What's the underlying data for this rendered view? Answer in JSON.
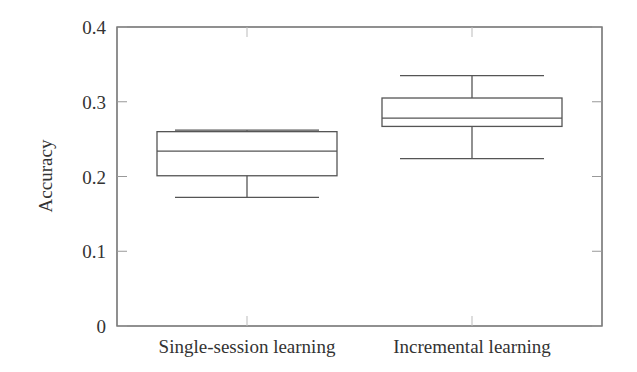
{
  "chart_data": {
    "type": "boxplot",
    "title": "",
    "xlabel": "",
    "ylabel": "Accuracy",
    "ylim": [
      0,
      0.4
    ],
    "yticks": [
      0,
      0.1,
      0.2,
      0.3,
      0.4
    ],
    "ytick_labels": [
      "0",
      "0.1",
      "0.2",
      "0.3",
      "0.4"
    ],
    "grid": false,
    "categories": [
      "Single-session learning",
      "Incremental learning"
    ],
    "series": [
      {
        "name": "Single-session learning",
        "whisker_low": 0.172,
        "q1": 0.201,
        "median": 0.234,
        "q3": 0.26,
        "whisker_high": 0.262
      },
      {
        "name": "Incremental learning",
        "whisker_low": 0.224,
        "q1": 0.267,
        "median": 0.278,
        "q3": 0.305,
        "whisker_high": 0.335
      }
    ]
  }
}
